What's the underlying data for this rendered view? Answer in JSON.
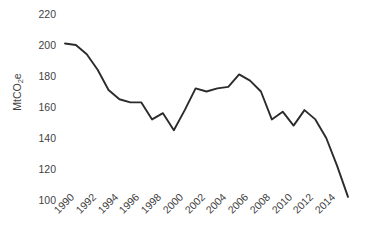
{
  "chart_data": {
    "type": "line",
    "title": "",
    "subtitle": "",
    "xlabel": "",
    "ylabel": "MtCO2e",
    "ylabel_parts": {
      "pre": "MtCO",
      "sub": "2",
      "post": "e"
    },
    "ylim": [
      100,
      220
    ],
    "xlim": [
      1990,
      2016
    ],
    "grid": false,
    "legend": "none",
    "series_color": "#2b2b2b",
    "markers": false,
    "yticks": [
      220,
      200,
      180,
      160,
      140,
      120,
      100
    ],
    "ytick_labels": [
      "220",
      "200",
      "180",
      "160",
      "140",
      "120",
      "100"
    ],
    "xticks": [
      1990,
      1992,
      1994,
      1996,
      1998,
      2000,
      2002,
      2004,
      2006,
      2008,
      2010,
      2012,
      2014
    ],
    "xtick_labels": [
      "1990",
      "1992",
      "1994",
      "1996",
      "1998",
      "2000",
      "2002",
      "2004",
      "2006",
      "2008",
      "2010",
      "2012",
      "2014"
    ],
    "x": [
      1990,
      1991,
      1992,
      1993,
      1994,
      1995,
      1996,
      1997,
      1998,
      1999,
      2000,
      2001,
      2002,
      2003,
      2004,
      2005,
      2006,
      2007,
      2008,
      2009,
      2010,
      2011,
      2012,
      2013,
      2014,
      2015,
      2016
    ],
    "values": [
      201,
      200,
      194,
      184,
      171,
      165,
      163,
      163,
      152,
      156,
      145,
      158,
      172,
      170,
      172,
      173,
      181,
      177,
      170,
      152,
      157,
      148,
      158,
      152,
      140,
      122,
      102
    ],
    "series": [
      {
        "name": "Emissions",
        "values": [
          201,
          200,
          194,
          184,
          171,
          165,
          163,
          163,
          152,
          156,
          145,
          158,
          172,
          170,
          172,
          173,
          181,
          177,
          170,
          152,
          157,
          148,
          158,
          152,
          140,
          122,
          102
        ]
      }
    ]
  }
}
